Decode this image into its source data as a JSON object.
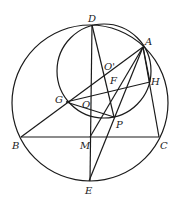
{
  "diagram": {
    "type": "geometry",
    "stroke_color": "#1a1a1a",
    "points": {
      "A": {
        "label": "A",
        "x": 143,
        "y": 47
      },
      "B": {
        "label": "B",
        "x": 21,
        "y": 137
      },
      "C": {
        "label": "C",
        "x": 159,
        "y": 137
      },
      "D": {
        "label": "D",
        "x": 92,
        "y": 25
      },
      "E": {
        "label": "E",
        "x": 89,
        "y": 181
      },
      "F": {
        "label": "F",
        "x": 112,
        "y": 85
      },
      "G": {
        "label": "G",
        "x": 68,
        "y": 101
      },
      "H": {
        "label": "H",
        "x": 150,
        "y": 82
      },
      "M": {
        "label": "M",
        "x": 91,
        "y": 137
      },
      "O": {
        "label": "O",
        "x": 90,
        "y": 100
      },
      "O1": {
        "label": "O'",
        "x": 109,
        "y": 70
      },
      "P": {
        "label": "P",
        "x": 114,
        "y": 117
      }
    },
    "circles": [
      {
        "name": "circumcircle",
        "cx": 90,
        "cy": 103,
        "r": 78
      },
      {
        "name": "small-circle",
        "cx": 104,
        "cy": 71,
        "r": 47
      }
    ]
  }
}
